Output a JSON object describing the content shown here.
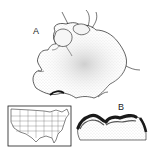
{
  "figure": {
    "panel_a": {
      "label": "A",
      "description": "Whole thallus / fruiting body drawing with stippled surface and curled rhizine-like tips"
    },
    "panel_b": {
      "label": "B",
      "description": "Cross-section showing dark crenulated upper cortex over pale medulla"
    },
    "inset_map": {
      "description": "Outline map of the contiguous United States"
    }
  },
  "colors": {
    "ink": "#1a1a1a",
    "stipple": "#9a9a9a",
    "background": "#ffffff"
  }
}
